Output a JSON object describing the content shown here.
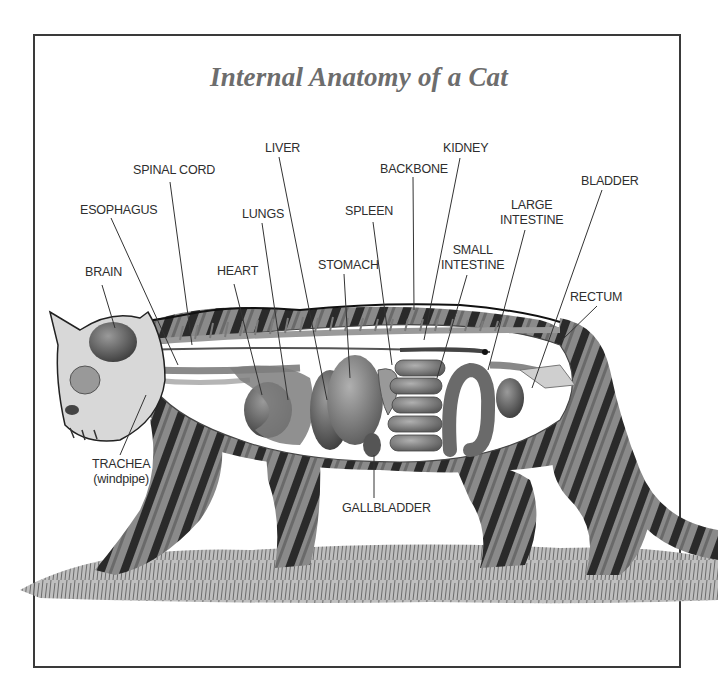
{
  "diagram": {
    "title": "Internal Anatomy of a Cat",
    "subject": "cat",
    "style": "grayscale illustration with cutaway body showing organs",
    "colors": {
      "frame": "#3a3a3a",
      "title": "#6d6d6d",
      "label_text": "#2e2e2e",
      "leader_line": "#333333"
    },
    "labels": [
      {
        "id": "brain",
        "text": "BRAIN"
      },
      {
        "id": "esophagus",
        "text": "ESOPHAGUS"
      },
      {
        "id": "spinal_cord",
        "text": "SPINAL CORD"
      },
      {
        "id": "liver",
        "text": "LIVER"
      },
      {
        "id": "lungs",
        "text": "LUNGS"
      },
      {
        "id": "heart",
        "text": "HEART"
      },
      {
        "id": "stomach",
        "text": "STOMACH"
      },
      {
        "id": "spleen",
        "text": "SPLEEN"
      },
      {
        "id": "backbone",
        "text": "BACKBONE"
      },
      {
        "id": "kidney",
        "text": "KIDNEY"
      },
      {
        "id": "small_intestine",
        "line1": "SMALL",
        "line2": "INTESTINE"
      },
      {
        "id": "large_intestine",
        "line1": "LARGE",
        "line2": "INTESTINE"
      },
      {
        "id": "bladder",
        "text": "BLADDER"
      },
      {
        "id": "rectum",
        "text": "RECTUM"
      },
      {
        "id": "trachea",
        "line1": "TRACHEA",
        "line2": "(windpipe)"
      },
      {
        "id": "gallbladder",
        "text": "GALLBLADDER"
      }
    ]
  }
}
